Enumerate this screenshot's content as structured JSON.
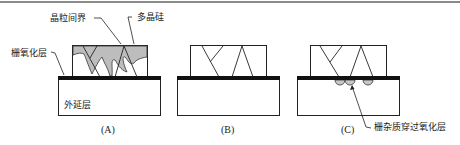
{
  "figure": {
    "colors": {
      "border_top": "#8a8a8a",
      "oxide": "#111111",
      "grain_fill": "#bdbdbd",
      "outline": "#222222",
      "dopant_fill": "#c8c8c8"
    },
    "labels": {
      "grain_boundary": "晶粒间界",
      "polysilicon": "多晶硅",
      "gate_oxide": "栅氧化层",
      "epitaxial_layer": "外延层",
      "gate_impurity_penetration": "栅杂质穿过氧化层"
    },
    "panels": [
      {
        "id": "A",
        "caption": "(A)"
      },
      {
        "id": "B",
        "caption": "(B)"
      },
      {
        "id": "C",
        "caption": "(C)"
      }
    ]
  }
}
